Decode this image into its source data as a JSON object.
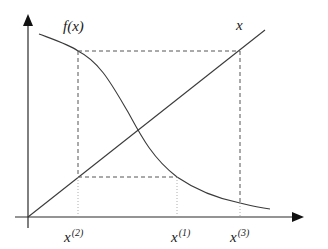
{
  "diagram": {
    "type": "fixed-point-iteration",
    "labels": {
      "curve": "f(x)",
      "identity_line": "x",
      "x2_base": "x",
      "x2_sup": "(2)",
      "x1_base": "x",
      "x1_sup": "(1)",
      "x3_base": "x",
      "x3_sup": "(3)"
    },
    "colors": {
      "stroke": "#3a3a3a",
      "axis": "#2a2a2a",
      "dashed": "#555555",
      "dotted": "#9a9a9a",
      "background": "#ffffff"
    },
    "elements": [
      "vertical axis with arrow",
      "horizontal axis with arrow",
      "identity line x",
      "decreasing curve f(x)",
      "dashed iteration rectangle",
      "dotted drop lines to x-axis"
    ]
  }
}
